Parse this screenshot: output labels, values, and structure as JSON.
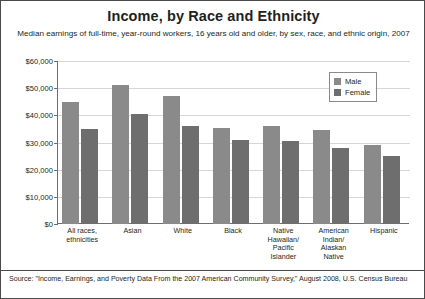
{
  "chart_data": {
    "type": "bar",
    "title": "Income, by Race and Ethnicity",
    "subtitle": "Median earnings of full-time, year-round workers, 16 years old and older, by sex, race, and ethnic origin, 2007",
    "xlabel": "",
    "ylabel": "",
    "ylim": [
      0,
      60000
    ],
    "ytick_values": [
      60000,
      50000,
      40000,
      30000,
      20000,
      10000,
      0
    ],
    "ytick_labels": [
      "$60,000",
      "$50,000",
      "$40,000",
      "$30,000",
      "$20,000",
      "$10,000",
      "$0"
    ],
    "grid": true,
    "legend_position": "top-right",
    "categories": [
      "All races, ethnicities",
      "Asian",
      "White",
      "Black",
      "Native Hawaiian/ Pacific Islander",
      "American Indian/ Alaskan Native",
      "Hispanic"
    ],
    "category_lines": [
      [
        "All races,",
        "ethnicities"
      ],
      [
        "Asian"
      ],
      [
        "White"
      ],
      [
        "Black"
      ],
      [
        "Native",
        "Hawaiian/",
        "Pacific",
        "Islander"
      ],
      [
        "American",
        "Indian/",
        "Alaskan",
        "Native"
      ],
      [
        "Hispanic"
      ]
    ],
    "series": [
      {
        "name": "Male",
        "color": "#8a8a8a",
        "values": [
          45000,
          51000,
          47000,
          35500,
          36000,
          34500,
          29000
        ]
      },
      {
        "name": "Female",
        "color": "#6e6e6e",
        "values": [
          35000,
          40500,
          36000,
          31000,
          30500,
          28000,
          25000
        ]
      }
    ],
    "source": "Source: \"Income, Earnings, and Poverty Data From the 2007 American Community Survey,\" August 2008, U.S. Census Bureau"
  },
  "legend": {
    "items": [
      {
        "label": "Male",
        "color": "#8a8a8a"
      },
      {
        "label": "Female",
        "color": "#6e6e6e"
      }
    ]
  },
  "colors": {
    "male": "#8a8a8a",
    "female": "#6e6e6e",
    "frame": "#4a4a4a",
    "axis": "#6e6e6e",
    "grid": "#d6d6d6",
    "text": "#231f20"
  }
}
